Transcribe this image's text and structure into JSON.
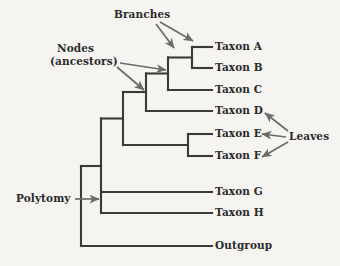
{
  "figure": {
    "kind": "phylogenetic-tree-diagram",
    "background_color": "#f5f4f1",
    "branch_color": "#3a3a3a",
    "arrow_color": "#6b6b6b",
    "text_color": "#2b2b2b"
  },
  "taxa": [
    {
      "id": "taxon-a",
      "label": "Taxon A",
      "y": 47
    },
    {
      "id": "taxon-b",
      "label": "Taxon B",
      "y": 68
    },
    {
      "id": "taxon-c",
      "label": "Taxon C",
      "y": 90
    },
    {
      "id": "taxon-d",
      "label": "Taxon D",
      "y": 111
    },
    {
      "id": "taxon-e",
      "label": "Taxon E",
      "y": 134
    },
    {
      "id": "taxon-f",
      "label": "Taxon F",
      "y": 156
    },
    {
      "id": "taxon-g",
      "label": "Taxon G",
      "y": 192
    },
    {
      "id": "taxon-h",
      "label": "Taxon H",
      "y": 213
    },
    {
      "id": "outgroup",
      "label": "Outgroup",
      "y": 246
    }
  ],
  "annotations": {
    "branches": {
      "label": "Branches",
      "x": 114,
      "y": 8
    },
    "nodes_line1": {
      "label": "Nodes",
      "x": 57,
      "y": 42
    },
    "nodes_line2": {
      "label": "(ancestors)",
      "x": 50,
      "y": 55
    },
    "leaves": {
      "label": "Leaves",
      "x": 289,
      "y": 130
    },
    "polytomy": {
      "label": "Polytomy",
      "x": 16,
      "y": 192
    }
  },
  "tree_structure": {
    "root_x": 81,
    "polytomy_node_x": 101,
    "clade_ab_x": 192,
    "clade_abc_x": 168,
    "clade_abcd_x": 146,
    "clade_def_x": 123,
    "clade_ef_x": 188,
    "tip_x": 212
  }
}
